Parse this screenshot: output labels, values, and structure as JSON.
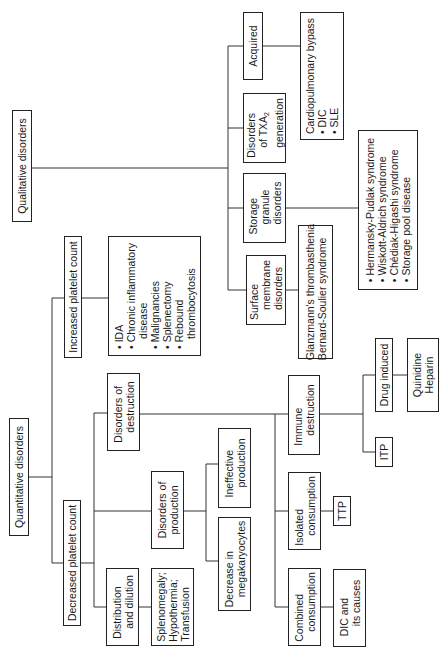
{
  "diagram": {
    "root_nodes": {
      "qualitative": "Qualitative disorders",
      "quantitative": "Quantitative disorders"
    },
    "quantitative": {
      "increased": {
        "label": "Increased platelet count",
        "causes": [
          "IDA",
          "Chronic inflammatory",
          "disease",
          "Malignancies",
          "Splenectomy",
          "Rebound",
          "thrombocytosis"
        ]
      },
      "decreased": {
        "label": "Decreased platelet count",
        "distribution": {
          "label_1": "Distribution",
          "label_2": "and dilution",
          "causes": [
            "Splenomegaly;",
            "Hypothermia;",
            "Transfusion"
          ]
        },
        "production": {
          "label_1": "Disorders of",
          "label_2": "production",
          "ineffective": [
            "Ineffective",
            "production"
          ],
          "decrease": [
            "Decrease in",
            "megakaryocytes"
          ]
        },
        "destruction": {
          "label_1": "Disorders of",
          "label_2": "destruction",
          "immune": {
            "label": [
              "Immune",
              "destruction"
            ],
            "itp": "ITP",
            "drug": {
              "label": "Drug induced",
              "causes": [
                "Quinidine",
                "Heparin"
              ]
            }
          },
          "isolated": {
            "label": [
              "Isolated",
              "consumption"
            ],
            "cause": "TTP"
          },
          "combined": {
            "label": [
              "Combined",
              "consumption"
            ],
            "cause": [
              "DIC and",
              "its causes"
            ]
          }
        }
      }
    },
    "qualitative": {
      "surface": {
        "label": [
          "Surface",
          "membrane",
          "disorders"
        ],
        "causes": [
          "Glanzmann's thrombasthenia",
          "Bernard-Soulier syndrome"
        ]
      },
      "storage": {
        "label": [
          "Storage",
          "granule",
          "disorders"
        ],
        "causes": [
          "Hermansky-Pudlak syndrome",
          "Wiskott-Aldrich syndrome",
          "Chédiak-Higashi syndrome",
          "Storage pool disease"
        ]
      },
      "txa2": {
        "label_1": "Disorders",
        "label_2_prefix": "of TXA",
        "label_2_sub": "2",
        "label_3": "generation"
      },
      "acquired": {
        "label": "Acquired",
        "causes_title": "Cardiopulmonary bypass",
        "causes": [
          "DIC",
          "SLE"
        ]
      }
    }
  }
}
